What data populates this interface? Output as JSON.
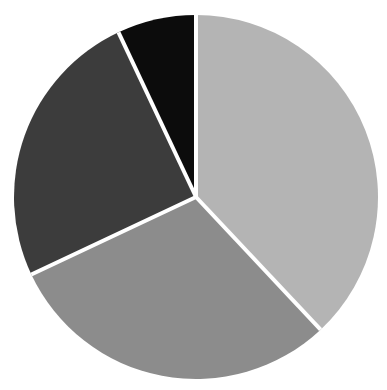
{
  "chart_data": {
    "type": "pie",
    "title": "",
    "labels": [
      "Slice A",
      "Slice B",
      "Slice C",
      "Slice D"
    ],
    "values": [
      38,
      30,
      25,
      7
    ],
    "colors": [
      "#b4b4b4",
      "#8c8c8c",
      "#3c3c3c",
      "#0c0c0c"
    ],
    "start_angle_deg": 0,
    "direction": "clockwise",
    "separator_color": "#ffffff",
    "legend": "none",
    "data_labels": "none"
  },
  "layout": {
    "center": [
      196,
      197
    ],
    "radius": 182,
    "separator_width": 4
  }
}
